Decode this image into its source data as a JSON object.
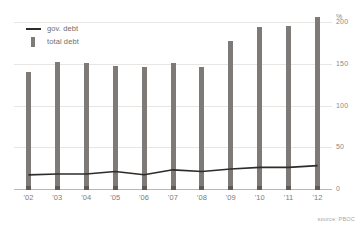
{
  "chart_data": {
    "type": "bar",
    "title": "",
    "subtitle": "",
    "xlabel": "",
    "ylabel": "",
    "yunit": "%",
    "ylim": [
      0,
      210
    ],
    "yticks": [
      0,
      50,
      100,
      150,
      200
    ],
    "ytick_labels": [
      "0",
      "50",
      "100",
      "150",
      "200"
    ],
    "grid": true,
    "legend_position": "top-left",
    "categories": [
      "'02",
      "'03",
      "'04",
      "'05",
      "'06",
      "'07",
      "'08",
      "'09",
      "'10",
      "'11",
      "'12"
    ],
    "series": [
      {
        "name": "total debt",
        "type": "bar",
        "color": "#7d7a78",
        "values": [
          140,
          153,
          151,
          148,
          147,
          151,
          147,
          178,
          194,
          196,
          207
        ]
      },
      {
        "name": "gov. debt",
        "type": "line",
        "color": "#2e2c2b",
        "values": [
          17,
          18,
          18,
          21,
          17,
          23,
          21,
          24,
          26,
          26,
          28
        ]
      }
    ],
    "annotations": [
      "source: PBOC"
    ]
  },
  "legend": {
    "items": [
      {
        "label": "gov. debt",
        "marker": "line-swatch"
      },
      {
        "label": "total debt",
        "marker": "bar-swatch"
      }
    ]
  },
  "axis": {
    "y_unit_label": "%",
    "y_tick_labels": [
      "200",
      "150",
      "100",
      "50",
      "0"
    ],
    "x_tick_labels": [
      "'02",
      "'03",
      "'04",
      "'05",
      "'06",
      "'07",
      "'08",
      "'09",
      "'10",
      "'11",
      "'12"
    ]
  },
  "footer": {
    "source": "source: PBOC"
  },
  "colors": {
    "bar": "#7d7a78",
    "line": "#2e2c2b",
    "grid": "#e8e6e4",
    "axis": "#b9b6b3",
    "text": "#7e7b79"
  }
}
